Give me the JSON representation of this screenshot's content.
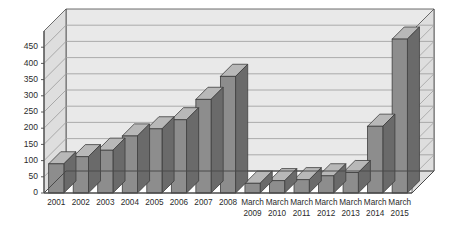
{
  "chart_data": {
    "type": "bar",
    "title": "",
    "subtitle": "",
    "xlabel": "",
    "ylabel": "",
    "categories": [
      "2001",
      "2002",
      "2003",
      "2004",
      "2005",
      "2006",
      "2007",
      "2008",
      "March 2009",
      "March 2010",
      "March 2011",
      "March 2012",
      "March 2013",
      "March 2014",
      "March 2015"
    ],
    "category_lines": [
      [
        "2001"
      ],
      [
        "2002"
      ],
      [
        "2003"
      ],
      [
        "2004"
      ],
      [
        "2005"
      ],
      [
        "2006"
      ],
      [
        "2007"
      ],
      [
        "2008"
      ],
      [
        "March",
        "2009"
      ],
      [
        "March",
        "2010"
      ],
      [
        "March",
        "2011"
      ],
      [
        "March",
        "2012"
      ],
      [
        "March",
        "2013"
      ],
      [
        "March",
        "2014"
      ],
      [
        "March",
        "2015"
      ]
    ],
    "values": [
      90,
      112,
      132,
      176,
      198,
      226,
      289,
      360,
      30,
      38,
      41,
      53,
      63,
      206,
      475
    ],
    "ylim": [
      0,
      500
    ],
    "yticks": [
      0,
      50,
      100,
      150,
      200,
      250,
      300,
      350,
      400,
      450
    ],
    "ytick_labels": [
      "0",
      "50",
      "100",
      "150",
      "200",
      "250",
      "300",
      "350",
      "400",
      "450"
    ],
    "grid": true,
    "legend": false,
    "legend_position": "none",
    "three_d": true,
    "series": [
      {
        "name": "",
        "values": [
          90,
          112,
          132,
          176,
          198,
          226,
          289,
          360,
          30,
          38,
          41,
          53,
          63,
          206,
          475
        ]
      }
    ]
  },
  "style": {
    "bar_front_color": "#8d8d8d",
    "bar_side_color": "#6a6a6a",
    "bar_top_color": "#b8b8b8",
    "bar_edge_color": "#3d3d3d",
    "plot_background": "#e9e9e9",
    "plot_side_wall": "#dedede",
    "plot_floor": "#e4e4e4",
    "grid_color": "#9a9a9a",
    "axis_color": "#4a4a4a",
    "text_color": "#2b2b2b",
    "page_background": "#ffffff"
  }
}
